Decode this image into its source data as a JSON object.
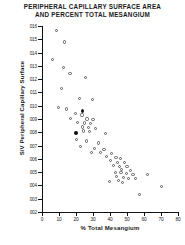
{
  "chart_data": {
    "type": "scatter",
    "title": "PERIPHERAL CAPILLARY SURFACE AREA AND PERCENT TOTAL MESANGIUM",
    "title_lines": [
      "PERIPHERAL CAPILLARY SURFACE AREA",
      "AND PERCENT TOTAL MESANGIUM"
    ],
    "xlabel": "% Total Mesangium",
    "ylabel": "S/V Peripheral Capillary Surface",
    "xlim": [
      0,
      80
    ],
    "ylim": [
      0.02,
      0.16
    ],
    "xticks": [
      0,
      10,
      20,
      30,
      40,
      50,
      60,
      70,
      80
    ],
    "xtick_labels": [
      "0",
      "10",
      "20",
      "30",
      "40",
      "50",
      "60",
      "70",
      "80"
    ],
    "yticks": [
      0.02,
      0.03,
      0.04,
      0.05,
      0.06,
      0.07,
      0.08,
      0.09,
      0.1,
      0.11,
      0.12,
      0.13,
      0.14,
      0.15,
      0.16
    ],
    "ytick_labels": [
      "002",
      "003",
      "004",
      "005",
      "006",
      "007",
      "008",
      "009",
      "010",
      "011",
      "012",
      "013",
      "014",
      "015",
      "016"
    ],
    "grid": false,
    "legend": null,
    "marker_styles": {
      "open": "open-circle",
      "filled": "filled-square"
    },
    "series": [
      {
        "name": "open",
        "marker": "open",
        "points": [
          [
            8.5,
            0.1565
          ],
          [
            13.0,
            0.148
          ],
          [
            6.0,
            0.1345
          ],
          [
            12.5,
            0.129
          ],
          [
            16.5,
            0.1245
          ],
          [
            25.5,
            0.121
          ],
          [
            11.5,
            0.113
          ],
          [
            22.0,
            0.1055
          ],
          [
            29.5,
            0.1045
          ],
          [
            9.5,
            0.0985
          ],
          [
            14.5,
            0.0975
          ],
          [
            19.5,
            0.094
          ],
          [
            23.5,
            0.093
          ],
          [
            17.0,
            0.0905
          ],
          [
            26.5,
            0.09
          ],
          [
            30.0,
            0.0895
          ],
          [
            21.0,
            0.0875
          ],
          [
            25.0,
            0.087
          ],
          [
            28.5,
            0.0865
          ],
          [
            24.0,
            0.084
          ],
          [
            27.5,
            0.0835
          ],
          [
            31.5,
            0.083
          ],
          [
            24.5,
            0.081
          ],
          [
            28.0,
            0.0805
          ],
          [
            37.5,
            0.079
          ],
          [
            20.5,
            0.0745
          ],
          [
            26.0,
            0.0735
          ],
          [
            33.0,
            0.072
          ],
          [
            22.5,
            0.069
          ],
          [
            31.0,
            0.068
          ],
          [
            36.5,
            0.067
          ],
          [
            29.0,
            0.065
          ],
          [
            34.5,
            0.0645
          ],
          [
            41.0,
            0.064
          ],
          [
            38.0,
            0.062
          ],
          [
            43.5,
            0.061
          ],
          [
            46.0,
            0.06
          ],
          [
            40.5,
            0.0585
          ],
          [
            44.5,
            0.0575
          ],
          [
            48.5,
            0.057
          ],
          [
            42.0,
            0.055
          ],
          [
            45.5,
            0.0545
          ],
          [
            50.0,
            0.054
          ],
          [
            47.0,
            0.052
          ],
          [
            52.0,
            0.0515
          ],
          [
            43.0,
            0.05
          ],
          [
            46.5,
            0.0495
          ],
          [
            49.5,
            0.049
          ],
          [
            53.5,
            0.0485
          ],
          [
            44.0,
            0.0465
          ],
          [
            48.0,
            0.046
          ],
          [
            51.0,
            0.0455
          ],
          [
            55.0,
            0.045
          ],
          [
            45.0,
            0.044
          ],
          [
            39.5,
            0.043
          ],
          [
            47.5,
            0.0425
          ],
          [
            62.0,
            0.0485
          ],
          [
            70.5,
            0.039
          ],
          [
            57.5,
            0.033
          ]
        ]
      },
      {
        "name": "filled",
        "marker": "filled",
        "points": [
          [
            24.0,
            0.096
          ],
          [
            20.0,
            0.0795
          ]
        ]
      }
    ]
  }
}
